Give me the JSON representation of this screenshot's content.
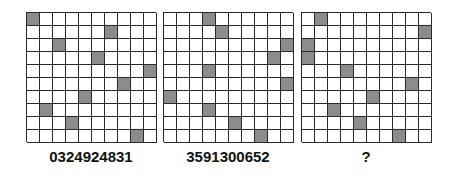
{
  "puzzle": {
    "panels": [
      {
        "label": "0324924831",
        "shaded_columns_by_row": [
          0,
          6,
          2,
          5,
          9,
          7,
          4,
          1,
          3,
          8
        ]
      },
      {
        "label": "3591300652",
        "shaded_columns_by_row": [
          3,
          4,
          9,
          8,
          3,
          9,
          0,
          3,
          5,
          7
        ]
      },
      {
        "label": "?",
        "shaded_columns_by_row": [
          1,
          9,
          0,
          0,
          3,
          8,
          5,
          2,
          4,
          7
        ]
      }
    ],
    "grid_size": 10,
    "colors": {
      "shaded": "#8c8c8c",
      "lines": "#2a2a2a",
      "background": "#ffffff"
    }
  }
}
